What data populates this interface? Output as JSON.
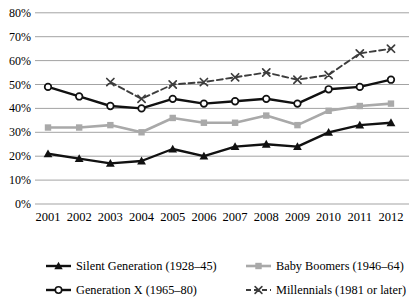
{
  "chart_data": {
    "type": "line",
    "title": "",
    "xlabel": "",
    "ylabel": "",
    "x": [
      2001,
      2002,
      2003,
      2004,
      2005,
      2006,
      2007,
      2008,
      2009,
      2010,
      2011,
      2012
    ],
    "x_tick_labels": [
      "2001",
      "2002",
      "2003",
      "2004",
      "2005",
      "2006",
      "2007",
      "2008",
      "2009",
      "2010",
      "2011",
      "2012"
    ],
    "ylim": [
      0,
      80
    ],
    "y_tick_step": 10,
    "y_tick_labels": [
      "0%",
      "10%",
      "20%",
      "30%",
      "40%",
      "50%",
      "60%",
      "70%",
      "80%"
    ],
    "grid": "horizontal",
    "grid_color": "#a3a3a3",
    "legend_position": "bottom",
    "series": [
      {
        "name": "Silent Generation (1928–45)",
        "marker": "triangle",
        "color": "#111111",
        "line_style": "solid",
        "line_width": 2.4,
        "values": [
          21,
          19,
          17,
          18,
          23,
          20,
          24,
          25,
          24,
          30,
          33,
          34
        ]
      },
      {
        "name": "Baby Boomers (1946–64)",
        "marker": "square",
        "color": "#a9a9a9",
        "line_style": "solid",
        "line_width": 2.6,
        "values": [
          32,
          32,
          33,
          30,
          36,
          34,
          34,
          37,
          33,
          39,
          41,
          42
        ]
      },
      {
        "name": "Generation X (1965–80)",
        "marker": "circle",
        "color": "#111111",
        "line_style": "solid",
        "line_width": 2.4,
        "values": [
          49,
          45,
          41,
          40,
          44,
          42,
          43,
          44,
          42,
          48,
          49,
          52
        ]
      },
      {
        "name": "Millennials (1981 or later)",
        "marker": "x",
        "color": "#3d3d3d",
        "line_style": "dashed",
        "line_width": 1.9,
        "values": [
          null,
          null,
          51,
          44,
          50,
          51,
          53,
          55,
          52,
          54,
          63,
          65
        ]
      }
    ],
    "legend_order": [
      0,
      1,
      2,
      3
    ]
  }
}
